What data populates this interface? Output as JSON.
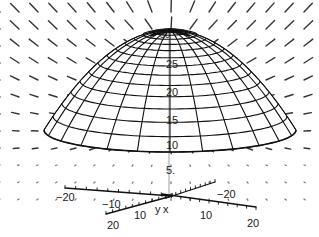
{
  "chart_data": {
    "type": "surface3d",
    "title": "",
    "surface": {
      "shape": "paraboloid cap",
      "apex_z": 30,
      "rim_z": 10,
      "rings": 14,
      "meridians": 24
    },
    "axes": {
      "x": {
        "label": "x",
        "ticks": [
          -20,
          10,
          20
        ],
        "range": [
          -20,
          20
        ]
      },
      "y": {
        "label": "y",
        "ticks": [
          -20,
          -10,
          10,
          20
        ],
        "range": [
          -20,
          20
        ]
      },
      "z": {
        "label": "",
        "ticks": [
          5,
          10,
          15,
          20,
          25,
          30
        ],
        "range": [
          0,
          30
        ]
      }
    },
    "vector_field": {
      "pattern": "radial, pointing outward/upward from dome; larger above, small dots near ground plane",
      "color": "#111111"
    },
    "grid": false,
    "legend": null
  },
  "labels": {
    "z30": "30",
    "z25": "25",
    "z20": "20",
    "z15": "15",
    "z10": "10",
    "z5": "5.",
    "x_neg20": "−20",
    "x_neg10": "−10",
    "y_label": "y",
    "x_label": "x",
    "y_pos10": "10",
    "y_pos20": "20",
    "x_pos10": "10",
    "x_pos20": "20",
    "y_neg20": "−20"
  },
  "colors": {
    "ink": "#111111",
    "background": "#ffffff"
  }
}
